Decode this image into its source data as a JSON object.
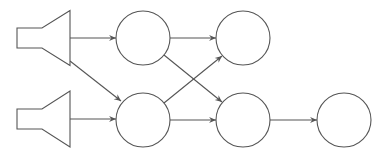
{
  "diagram": {
    "type": "network-graph",
    "stroke_color": "#555555",
    "background": "#ffffff",
    "inputs": [
      {
        "id": "speaker-1",
        "shape": "speaker",
        "x": 17,
        "cy": 38,
        "rect_w": 25,
        "rect_h": 20,
        "cone_w": 28,
        "cone_h": 55
      },
      {
        "id": "speaker-2",
        "shape": "speaker",
        "x": 17,
        "cy": 119,
        "rect_w": 25,
        "rect_h": 20,
        "cone_w": 28,
        "cone_h": 56
      }
    ],
    "nodes": [
      {
        "id": "node-1",
        "shape": "circle",
        "cx": 143,
        "cy": 38,
        "r": 27
      },
      {
        "id": "node-2",
        "shape": "circle",
        "cx": 243,
        "cy": 38,
        "r": 27
      },
      {
        "id": "node-3",
        "shape": "circle",
        "cx": 143,
        "cy": 120,
        "r": 27
      },
      {
        "id": "node-4",
        "shape": "circle",
        "cx": 243,
        "cy": 120,
        "r": 27
      },
      {
        "id": "node-5",
        "shape": "circle",
        "cx": 344,
        "cy": 120,
        "r": 27
      }
    ],
    "edges": [
      {
        "from": "speaker-1",
        "to": "node-1",
        "x1": 70,
        "y1": 38,
        "x2": 116,
        "y2": 38
      },
      {
        "from": "speaker-1",
        "to": "node-3",
        "x1": 70,
        "y1": 61,
        "x2": 121,
        "y2": 101
      },
      {
        "from": "speaker-2",
        "to": "node-3",
        "x1": 70,
        "y1": 119,
        "x2": 116,
        "y2": 119
      },
      {
        "from": "node-1",
        "to": "node-2",
        "x1": 170,
        "y1": 38,
        "x2": 216,
        "y2": 38
      },
      {
        "from": "node-1",
        "to": "node-4",
        "x1": 164,
        "y1": 55,
        "x2": 222,
        "y2": 102
      },
      {
        "from": "node-3",
        "to": "node-2",
        "x1": 164,
        "y1": 103,
        "x2": 222,
        "y2": 56
      },
      {
        "from": "node-3",
        "to": "node-4",
        "x1": 170,
        "y1": 120,
        "x2": 216,
        "y2": 120
      },
      {
        "from": "node-4",
        "to": "node-5",
        "x1": 270,
        "y1": 120,
        "x2": 317,
        "y2": 120
      }
    ]
  }
}
